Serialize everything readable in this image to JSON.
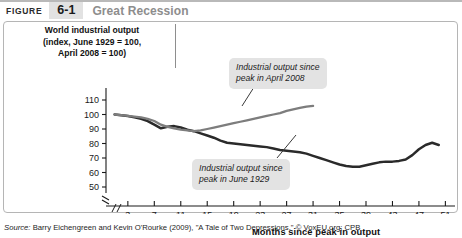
{
  "header": {
    "figure_word": "FIGURE",
    "figure_number": "6-1",
    "figure_title": "Great Recession"
  },
  "axis_title_block": {
    "line1": "World industrial output",
    "line2": "(index, June 1929 = 100,",
    "line3": "April 2008 = 100)"
  },
  "callouts": {
    "recession_2008": "Industrial output since\npeak in April 2008",
    "recession_2008_l1": "Industrial output since",
    "recession_2008_l2": "peak in April 2008",
    "depression_1929_l1": "Industrial output since",
    "depression_1929_l2": "peak in June 1929"
  },
  "source": {
    "label": "Source:",
    "text": " Barry Eichengreen and Kevin O'Rourke (2009), \"A Tale of Two Depressions.\" © VoxEU.org; CPB"
  },
  "colors": {
    "line_1929": "#2a2a2a",
    "line_2008": "#7d7d7d",
    "axis": "#1a1a1a",
    "callout_bg": "#e3e3e3",
    "badge_bg": "#e2e2e2",
    "title_gray": "#8d8d8d",
    "panel_border": "#b5b5b5"
  },
  "chart_data": {
    "type": "line",
    "title": "World industrial output",
    "subtitle": "(index, June 1929 = 100, April 2008 = 100)",
    "xlabel": "Months since peak in output",
    "ylabel": "World industrial output (index)",
    "xlim": [
      0,
      52
    ],
    "ylim": [
      50,
      110
    ],
    "yticks": [
      110,
      100,
      90,
      80,
      70,
      60,
      50
    ],
    "xticks": [
      3,
      7,
      11,
      15,
      19,
      23,
      27,
      31,
      35,
      39,
      43,
      47,
      51
    ],
    "y_axis_break": true,
    "x_axis_break": true,
    "grid": false,
    "legend": "annotations",
    "series": [
      {
        "name": "Industrial output since peak in June 1929",
        "color": "#2a2a2a",
        "x": [
          1,
          2,
          3,
          4,
          5,
          6,
          7,
          8,
          9,
          10,
          11,
          12,
          13,
          14,
          15,
          16,
          17,
          18,
          19,
          20,
          21,
          22,
          23,
          24,
          25,
          26,
          27,
          28,
          29,
          30,
          31,
          32,
          33,
          34,
          35,
          36,
          37,
          38,
          39,
          40,
          41,
          42,
          43,
          44,
          45,
          46,
          47,
          48,
          49,
          50
        ],
        "values": [
          100,
          99.5,
          99,
          98,
          97,
          95.5,
          93,
          90.5,
          91.5,
          92,
          91,
          89.5,
          88.5,
          87,
          85.5,
          84,
          82,
          80.5,
          80,
          79.5,
          79,
          78.5,
          78,
          77.5,
          76.5,
          75.5,
          75,
          74.5,
          74,
          73,
          71.5,
          70,
          68.5,
          67,
          65.5,
          64.5,
          64,
          64,
          65,
          66,
          67,
          67.5,
          67.5,
          68,
          69,
          72,
          76,
          79,
          80.5,
          79
        ]
      },
      {
        "name": "Industrial output since peak in April 2008",
        "color": "#7d7d7d",
        "x": [
          1,
          2,
          3,
          4,
          5,
          6,
          7,
          8,
          9,
          10,
          11,
          12,
          13,
          14,
          15,
          16,
          17,
          18,
          19,
          20,
          21,
          22,
          23,
          24,
          25,
          26,
          27,
          28,
          29,
          30,
          31
        ],
        "values": [
          100,
          99.5,
          99,
          98.5,
          98,
          97,
          95.5,
          93,
          91.5,
          90.5,
          89.5,
          89,
          88.5,
          89,
          90,
          91,
          92,
          93,
          94,
          95,
          96,
          97,
          98,
          99,
          100,
          101,
          102.5,
          103.5,
          104.5,
          105.5,
          106
        ]
      }
    ]
  }
}
